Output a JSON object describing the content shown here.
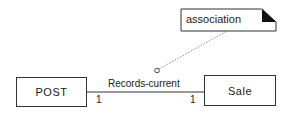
{
  "diagram": {
    "note": {
      "label": "association"
    },
    "classes": [
      {
        "name": "POST"
      },
      {
        "name": "Sale"
      }
    ],
    "association": {
      "name": "Records-current",
      "multiplicity_left": "1",
      "multiplicity_right": "1"
    },
    "colors": {
      "line": "#333333",
      "dotted": "#888888",
      "fold": "#111111"
    }
  }
}
